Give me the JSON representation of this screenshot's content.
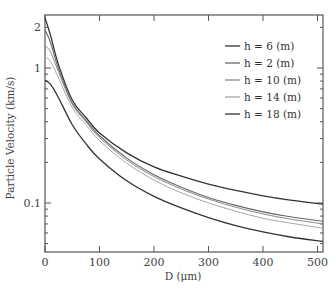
{
  "chart_data": {
    "type": "line",
    "title": "",
    "xlabel": "D (μm)",
    "ylabel": "Particle Velocity (km/s)",
    "xlim": [
      0,
      510
    ],
    "ylim": [
      0.043,
      2.47
    ],
    "yscale": "log",
    "x_ticks": [
      0,
      100,
      200,
      300,
      400,
      500
    ],
    "x_tick_labels": [
      "0",
      "100",
      "200",
      "300",
      "400",
      "500"
    ],
    "y_ticks": [
      0.1,
      1,
      2
    ],
    "y_tick_labels": [
      "0.1",
      "1",
      "2"
    ],
    "grid": false,
    "legend_position": "upper right",
    "x": [
      0,
      10,
      25,
      50,
      75,
      100,
      150,
      200,
      250,
      300,
      350,
      400,
      450,
      510
    ],
    "series": [
      {
        "name": "h = 6 (m)",
        "color": "#333333",
        "width": 1.3,
        "values": [
          2.35,
          1.75,
          1.05,
          0.58,
          0.43,
          0.33,
          0.235,
          0.185,
          0.158,
          0.138,
          0.124,
          0.113,
          0.105,
          0.098
        ]
      },
      {
        "name": "h = 2 (m)",
        "color": "#666666",
        "width": 1.1,
        "values": [
          1.91,
          1.55,
          0.98,
          0.55,
          0.41,
          0.315,
          0.215,
          0.162,
          0.131,
          0.11,
          0.096,
          0.086,
          0.079,
          0.073
        ]
      },
      {
        "name": "h = 10 (m)",
        "color": "#8a8a8a",
        "width": 1.0,
        "values": [
          1.46,
          1.32,
          0.93,
          0.54,
          0.4,
          0.305,
          0.208,
          0.157,
          0.127,
          0.107,
          0.093,
          0.083,
          0.076,
          0.07
        ]
      },
      {
        "name": "h = 14 (m)",
        "color": "#a8a8a8",
        "width": 1.0,
        "values": [
          1.21,
          1.12,
          0.84,
          0.51,
          0.38,
          0.29,
          0.197,
          0.148,
          0.119,
          0.1,
          0.087,
          0.077,
          0.071,
          0.065
        ]
      },
      {
        "name": "h = 18 (m)",
        "color": "#333333",
        "width": 1.3,
        "values": [
          0.81,
          0.76,
          0.6,
          0.38,
          0.275,
          0.212,
          0.146,
          0.112,
          0.092,
          0.078,
          0.068,
          0.061,
          0.056,
          0.052
        ]
      }
    ]
  },
  "axes": {
    "xlabel": "D (μm)",
    "ylabel": "Particle Velocity (km/s)"
  },
  "legend": {
    "items": [
      {
        "label": "h = 6 (m)",
        "color": "#333333"
      },
      {
        "label": "h = 2 (m)",
        "color": "#666666"
      },
      {
        "label": "h = 10 (m)",
        "color": "#8a8a8a"
      },
      {
        "label": "h = 14 (m)",
        "color": "#a8a8a8"
      },
      {
        "label": "h = 18 (m)",
        "color": "#333333"
      }
    ]
  }
}
